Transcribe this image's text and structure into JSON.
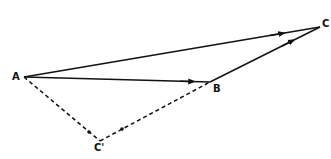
{
  "diagram": {
    "type": "vector-triangle",
    "points": {
      "A": {
        "label": "A",
        "x": 24,
        "y": 77
      },
      "B": {
        "label": "B",
        "x": 210,
        "y": 82
      },
      "C": {
        "label": "C",
        "x": 320,
        "y": 27
      },
      "Cp": {
        "label": "C'",
        "x": 100,
        "y": 141
      }
    },
    "edges": [
      {
        "from": "A",
        "to": "C",
        "style": "solid",
        "arrow": "forward"
      },
      {
        "from": "A",
        "to": "B",
        "style": "solid",
        "arrow": "forward"
      },
      {
        "from": "B",
        "to": "C",
        "style": "solid",
        "arrow": "forward"
      },
      {
        "from": "A",
        "to": "Cp",
        "style": "dashed",
        "arrow": "forward"
      },
      {
        "from": "Cp",
        "to": "B",
        "style": "dashed",
        "arrow": "forward"
      }
    ],
    "colors": {
      "stroke": "#111111",
      "background": "#ffffff"
    }
  }
}
